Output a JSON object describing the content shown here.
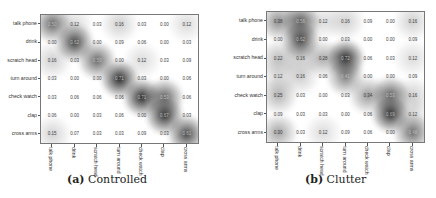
{
  "chart_data": [
    {
      "type": "heatmap",
      "title": "(a) Controlled",
      "caption_label": "(a)",
      "caption_text": "Controlled",
      "row_labels": [
        "talk phone",
        "drink",
        "scratch head",
        "turn around",
        "check watch",
        "clap",
        "cross arms"
      ],
      "col_labels": [
        "talk phone",
        "drink",
        "scratch head",
        "turn around",
        "check watch",
        "clap",
        "cross arms"
      ],
      "values": [
        [
          0.5,
          0.12,
          0.03,
          0.16,
          0.03,
          0.0,
          0.12
        ],
        [
          0.0,
          0.62,
          0.0,
          0.09,
          0.06,
          0.0,
          0.03
        ],
        [
          0.16,
          0.03,
          0.5,
          0.0,
          0.12,
          0.03,
          0.09
        ],
        [
          0.03,
          0.0,
          0.0,
          0.71,
          0.03,
          0.0,
          0.06
        ],
        [
          0.03,
          0.06,
          0.06,
          0.06,
          0.71,
          0.53,
          0.06
        ],
        [
          0.06,
          0.0,
          0.03,
          0.06,
          0.0,
          0.67,
          0.03
        ],
        [
          0.15,
          0.07,
          0.03,
          0.03,
          0.09,
          0.03,
          0.61
        ]
      ],
      "colormap": "grayscale (white=0, dark=high)",
      "cell_text_shown": true
    },
    {
      "type": "heatmap",
      "title": "(b) Clutter",
      "caption_label": "(b)",
      "caption_text": "Clutter",
      "row_labels": [
        "talk phone",
        "drink",
        "scratch head",
        "turn around",
        "check watch",
        "clap",
        "cross arms"
      ],
      "col_labels": [
        "talk phone",
        "drink",
        "scratch head",
        "turn around",
        "check watch",
        "clap",
        "cross arms"
      ],
      "values": [
        [
          0.38,
          0.56,
          0.12,
          0.16,
          0.09,
          0.0,
          0.16
        ],
        [
          0.0,
          0.62,
          0.0,
          0.03,
          0.0,
          0.0,
          0.09
        ],
        [
          0.22,
          0.16,
          0.28,
          0.72,
          0.06,
          0.03,
          0.12
        ],
        [
          0.12,
          0.16,
          0.06,
          0.41,
          0.0,
          0.0,
          0.09
        ],
        [
          0.25,
          0.03,
          0.0,
          0.03,
          0.34,
          0.53,
          0.16
        ],
        [
          0.09,
          0.03,
          0.03,
          0.0,
          0.06,
          0.69,
          0.12
        ],
        [
          0.3,
          0.03,
          0.12,
          0.09,
          0.06,
          0.0,
          0.48
        ]
      ],
      "colormap": "grayscale (white=0, dark=high)",
      "cell_text_shown": true
    }
  ]
}
